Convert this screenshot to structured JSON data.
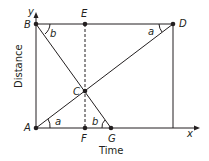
{
  "diagram": {
    "axes": {
      "x_label": "x",
      "y_label": "y",
      "x_title": "Time",
      "y_title": "Distance"
    },
    "points": {
      "A": "A",
      "B": "B",
      "C": "C",
      "D": "D",
      "E": "E",
      "F": "F",
      "G": "G"
    },
    "angles": {
      "at_A": "a",
      "at_D": "a",
      "at_B": "b",
      "at_G": "b"
    },
    "colors": {
      "line": "#231f20",
      "dashed": "#231f20"
    }
  }
}
